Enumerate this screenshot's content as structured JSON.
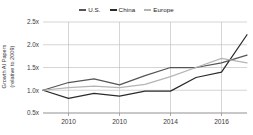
{
  "chart_data": {
    "type": "line",
    "title": "",
    "xlabel": "",
    "ylabel": "Growth AI Papers (relative to 2009)",
    "ylabel_line1": "Growth AI Papers",
    "ylabel_line2": "(relative to 2009)",
    "x": [
      2009,
      2010,
      2011,
      2012,
      2013,
      2014,
      2015,
      2016,
      2017
    ],
    "xtick_positions": [
      2010,
      2012,
      2014,
      2016
    ],
    "xtick_labels": [
      "2010",
      "2010",
      "2014",
      "2016"
    ],
    "ytick_values": [
      0.5,
      1.0,
      1.5,
      2.0,
      2.5
    ],
    "ytick_labels": [
      "0.5x",
      "1.0x",
      "1.5x",
      "2.0x",
      "2.5x"
    ],
    "xlim": [
      2009,
      2017
    ],
    "ylim": [
      0.5,
      2.5
    ],
    "grid": true,
    "legend_position": "top-center",
    "series": [
      {
        "name": "U.S.",
        "color": "#555555",
        "values": [
          1.0,
          1.17,
          1.25,
          1.12,
          1.32,
          1.5,
          1.5,
          1.6,
          1.77
        ]
      },
      {
        "name": "China",
        "color": "#2b2b2b",
        "values": [
          1.0,
          0.82,
          0.93,
          0.87,
          0.98,
          0.98,
          1.28,
          1.4,
          2.22
        ]
      },
      {
        "name": "Europe",
        "color": "#b4b4b4",
        "values": [
          1.0,
          1.06,
          1.09,
          1.06,
          1.13,
          1.3,
          1.5,
          1.7,
          1.6
        ]
      }
    ]
  },
  "legend": {
    "items": [
      {
        "label": "U.S.",
        "color": "#555555"
      },
      {
        "label": "China",
        "color": "#2b2b2b"
      },
      {
        "label": "Europe",
        "color": "#b4b4b4"
      }
    ]
  },
  "axis": {
    "y_title_line1": "Growth AI Papers",
    "y_title_line2": "(relative to 2009)"
  }
}
